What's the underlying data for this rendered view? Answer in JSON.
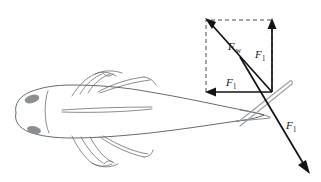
{
  "figure": {
    "background_color": "#ffffff",
    "width": 321,
    "height": 182
  },
  "subject": {
    "name": "fish-dorsal-view",
    "description": "Fish seen from above, head at left, body tapering to caudal peduncle at right",
    "outline_color": "#555a5e",
    "fill_color": "#ffffff",
    "eye_color": "#8a8f93",
    "fin_color": "#6a7074",
    "tail_ray_color": "#9aa0a4"
  },
  "force_diagram": {
    "origin_label": "force application point",
    "dashed_box_color": "#4a4a4a",
    "arrow_color": "#131313",
    "vectors": [
      {
        "id": "resultant",
        "symbol": "F",
        "subscript": "w",
        "label": "F_w",
        "direction": "up-left",
        "description": "Resultant water reaction force, diagonal of the dashed rectangle"
      },
      {
        "id": "vertical-component",
        "symbol": "F",
        "subscript": "l",
        "label": "F_l",
        "direction": "up",
        "description": "Vertical lift component of the water force"
      },
      {
        "id": "horizontal-component",
        "symbol": "F",
        "subscript": "l",
        "label": "F_l",
        "direction": "left",
        "description": "Horizontal component of the water force"
      },
      {
        "id": "thrust",
        "symbol": "F",
        "subscript": "l",
        "label": "F_l",
        "direction": "down-right",
        "description": "Reaction force along the tail axis, pointing down and to the right"
      }
    ]
  },
  "labels": {
    "resultant": {
      "symbol": "F",
      "subscript": "w"
    },
    "vertical": {
      "symbol": "F",
      "subscript": "l"
    },
    "horizontal": {
      "symbol": "F",
      "subscript": "l"
    },
    "thrust": {
      "symbol": "F",
      "subscript": "l"
    }
  }
}
